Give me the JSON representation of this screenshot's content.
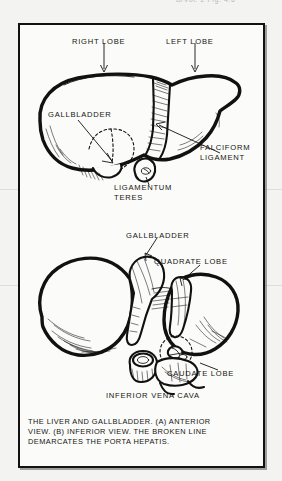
{
  "scan": {
    "clipped_header_text": "B/Vol. 2 Fig. 4.6",
    "background_color": "#f3f3f1",
    "ink_color": "#111111"
  },
  "figure": {
    "border_color": "#111111",
    "panel_background": "#fbfbfa",
    "anterior_view": {
      "labels": [
        {
          "id": "right-lobe",
          "text": "RIGHT LOBE"
        },
        {
          "id": "left-lobe",
          "text": "LEFT LOBE"
        },
        {
          "id": "gallbladder",
          "text": "GALLBLADDER"
        },
        {
          "id": "falciform-line-1",
          "text": "FALCIFORM"
        },
        {
          "id": "falciform-line-2",
          "text": "LIGAMENT"
        },
        {
          "id": "ligamentum-line-1",
          "text": "LIGAMENTUM"
        },
        {
          "id": "ligamentum-line-2",
          "text": "TERES"
        }
      ]
    },
    "inferior_view": {
      "labels": [
        {
          "id": "gallbladder",
          "text": "GALLBLADDER"
        },
        {
          "id": "quadrate-lobe",
          "text": "QUADRATE LOBE"
        },
        {
          "id": "caudate-lobe",
          "text": "CAUDATE LOBE"
        },
        {
          "id": "inferior-vena-cava",
          "text": "INFERIOR VENA CAVA"
        }
      ]
    },
    "caption": {
      "line1": "THE LIVER AND GALLBLADDER.  (A) ANTERIOR",
      "line2": "VIEW.  (B) INFERIOR VIEW.  THE BROKEN LINE",
      "line3": "DEMARCATES THE PORTA HEPATIS."
    }
  }
}
